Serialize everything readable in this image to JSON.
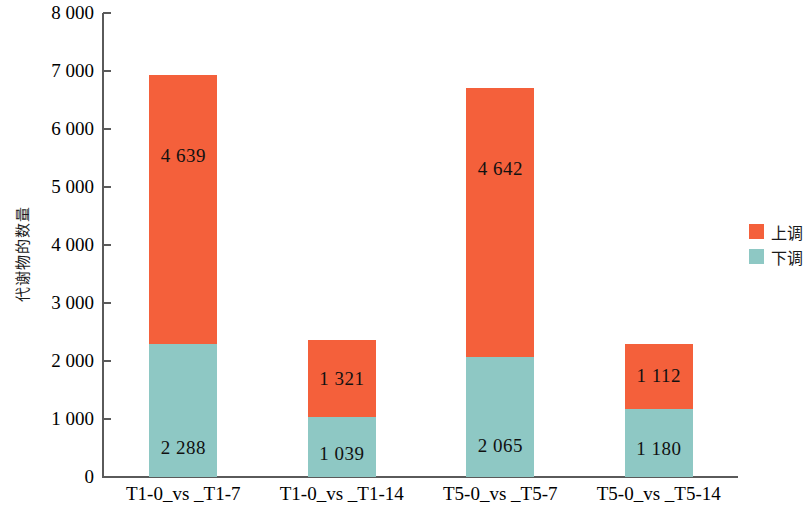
{
  "chart_data": {
    "type": "bar",
    "stacked": true,
    "title": "",
    "xlabel": "",
    "ylabel": "代谢物的数量",
    "ylim": [
      0,
      8000
    ],
    "ytick_step": 1000,
    "ytick_labels": [
      "8 000",
      "7 000",
      "6 000",
      "5 000",
      "4 000",
      "3 000",
      "2 000",
      "1 000",
      "0"
    ],
    "ytick_values": [
      8000,
      7000,
      6000,
      5000,
      4000,
      3000,
      2000,
      1000,
      0
    ],
    "grid": false,
    "legend_position": "right",
    "categories": [
      "T1-0_vs _T1-7",
      "T1-0_vs _T1-14",
      "T5-0_vs _T5-7",
      "T5-0_vs _T5-14"
    ],
    "series": [
      {
        "name": "上调",
        "color": "#F4603B",
        "values": [
          4639,
          1321,
          4642,
          1112
        ],
        "value_labels": [
          "4 639",
          "1 321",
          "4 642",
          "1 112"
        ]
      },
      {
        "name": "下调",
        "color": "#8EC8C4",
        "values": [
          2288,
          1039,
          2065,
          1180
        ],
        "value_labels": [
          "2 288",
          "1 039",
          "2 065",
          "1 180"
        ]
      }
    ],
    "totals": [
      6927,
      2360,
      6707,
      2292
    ]
  },
  "legend": {
    "items": [
      {
        "label": "上调",
        "color": "#F4603B"
      },
      {
        "label": "下调",
        "color": "#8EC8C4"
      }
    ]
  },
  "axis": {
    "y_title": "代谢物的数量"
  }
}
